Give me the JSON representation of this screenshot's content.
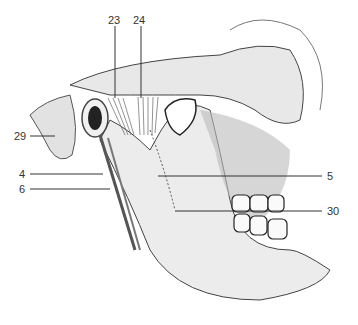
{
  "figure": {
    "labels": [
      {
        "id": "23",
        "text": "23",
        "x": 108,
        "y": 14
      },
      {
        "id": "24",
        "text": "24",
        "x": 133,
        "y": 14
      },
      {
        "id": "29",
        "text": "29",
        "x": 14,
        "y": 130
      },
      {
        "id": "4",
        "text": "4",
        "x": 19,
        "y": 169
      },
      {
        "id": "6",
        "text": "6",
        "x": 19,
        "y": 183
      },
      {
        "id": "5",
        "text": "5",
        "x": 327,
        "y": 170
      },
      {
        "id": "30",
        "text": "30",
        "x": 327,
        "y": 205
      }
    ],
    "colors": {
      "line": "#333333",
      "bone": "#e6e6e6",
      "shade": "#888888",
      "dark": "#222222"
    }
  }
}
